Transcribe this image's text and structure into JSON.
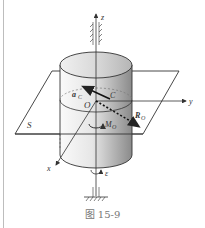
{
  "figure": {
    "caption": "图 15-9",
    "labels": {
      "z_axis": "z",
      "y_axis": "y",
      "x_axis": "x",
      "origin": "O",
      "center_of_mass": "C",
      "acceleration": "a",
      "acceleration_sub": "C",
      "resultant_force": "R",
      "resultant_force_sub": "O",
      "moment": "M",
      "moment_sub": "O",
      "plane": "S",
      "angular_accel": "ε"
    },
    "colors": {
      "line": "#333333",
      "cylinder_light": "#f4f4f4",
      "cylinder_dark": "#8c8c8c",
      "caption": "#777777"
    }
  }
}
